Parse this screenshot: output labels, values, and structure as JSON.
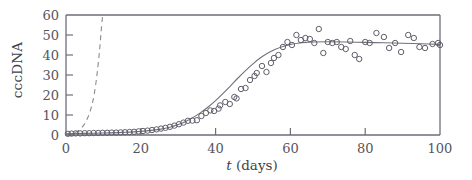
{
  "chart_data": {
    "type": "scatter",
    "title": "",
    "xlabel": "t (days)",
    "xlabel_italic_part": "t",
    "xlabel_rest": " (days)",
    "ylabel": "cccDNA",
    "xlim": [
      0,
      100
    ],
    "ylim": [
      0,
      60
    ],
    "xticks": [
      0,
      20,
      40,
      60,
      80,
      100
    ],
    "xtick_labels": [
      "0",
      "20",
      "40",
      "60",
      "80",
      "100"
    ],
    "yticks": [
      0,
      10,
      20,
      30,
      40,
      50,
      60
    ],
    "ytick_labels": [
      "0",
      "10",
      "20",
      "30",
      "40",
      "50",
      "60"
    ],
    "grid": false,
    "legend": "none",
    "series": [
      {
        "name": "cccDNA measurements",
        "marker": "open-circle",
        "color": "#5f5f6b",
        "points": [
          [
            0.5,
            0.6
          ],
          [
            1.5,
            0.7
          ],
          [
            2.6,
            0.8
          ],
          [
            3.8,
            0.8
          ],
          [
            5.0,
            0.9
          ],
          [
            6.2,
            0.9
          ],
          [
            7.4,
            1.0
          ],
          [
            8.6,
            1.0
          ],
          [
            9.8,
            1.1
          ],
          [
            11.0,
            1.1
          ],
          [
            12.2,
            1.2
          ],
          [
            13.4,
            1.2
          ],
          [
            14.6,
            1.3
          ],
          [
            15.8,
            1.4
          ],
          [
            17.0,
            1.5
          ],
          [
            18.2,
            1.6
          ],
          [
            19.4,
            1.8
          ],
          [
            20.6,
            2.0
          ],
          [
            21.8,
            2.2
          ],
          [
            23.0,
            2.5
          ],
          [
            24.2,
            2.8
          ],
          [
            25.4,
            3.2
          ],
          [
            26.6,
            3.6
          ],
          [
            27.8,
            4.1
          ],
          [
            29.0,
            4.7
          ],
          [
            30.2,
            5.4
          ],
          [
            31.4,
            6.2
          ],
          [
            32.6,
            7.1
          ],
          [
            33.8,
            7.2
          ],
          [
            35.0,
            7.4
          ],
          [
            36.2,
            9.5
          ],
          [
            37.4,
            11.0
          ],
          [
            38.6,
            12.3
          ],
          [
            39.6,
            12.0
          ],
          [
            40.8,
            13.2
          ],
          [
            41.2,
            14.8
          ],
          [
            42.6,
            16.5
          ],
          [
            43.8,
            15.5
          ],
          [
            45.0,
            19.0
          ],
          [
            45.6,
            18.3
          ],
          [
            46.8,
            23.0
          ],
          [
            48.0,
            23.5
          ],
          [
            49.2,
            27.5
          ],
          [
            50.4,
            29.5
          ],
          [
            51.0,
            31.0
          ],
          [
            52.4,
            34.5
          ],
          [
            53.6,
            31.5
          ],
          [
            54.8,
            36.0
          ],
          [
            55.6,
            38.5
          ],
          [
            56.8,
            40.0
          ],
          [
            58.0,
            44.0
          ],
          [
            59.2,
            46.5
          ],
          [
            60.4,
            45.0
          ],
          [
            61.6,
            50.0
          ],
          [
            62.8,
            47.5
          ],
          [
            64.0,
            48.5
          ],
          [
            65.2,
            48.0
          ],
          [
            66.4,
            46.0
          ],
          [
            67.6,
            53.0
          ],
          [
            68.8,
            41.0
          ],
          [
            70.0,
            46.5
          ],
          [
            71.2,
            46.0
          ],
          [
            72.4,
            46.5
          ],
          [
            73.6,
            44.0
          ],
          [
            74.8,
            43.0
          ],
          [
            76.0,
            47.0
          ],
          [
            77.2,
            40.0
          ],
          [
            78.4,
            38.0
          ],
          [
            80.0,
            46.5
          ],
          [
            81.2,
            46.0
          ],
          [
            83.0,
            51.0
          ],
          [
            85.0,
            49.0
          ],
          [
            86.4,
            43.5
          ],
          [
            88.0,
            46.0
          ],
          [
            89.6,
            41.5
          ],
          [
            91.5,
            50.0
          ],
          [
            93.0,
            48.5
          ],
          [
            94.5,
            44.0
          ],
          [
            96.0,
            43.5
          ],
          [
            98.0,
            45.5
          ],
          [
            99.5,
            46.0
          ],
          [
            100.0,
            45.0
          ]
        ]
      }
    ],
    "curves": [
      {
        "name": "sigmoid-fit",
        "style": "solid",
        "color": "#70707c",
        "description": "Fitted logistic growth curve: slow rise to day 30, steep rise day 35-60, plateau near 46",
        "points": [
          [
            0,
            0.6
          ],
          [
            5,
            0.8
          ],
          [
            10,
            1.0
          ],
          [
            15,
            1.3
          ],
          [
            20,
            1.8
          ],
          [
            25,
            2.8
          ],
          [
            28,
            4.0
          ],
          [
            30,
            5.2
          ],
          [
            32,
            6.8
          ],
          [
            34,
            8.8
          ],
          [
            36,
            11.2
          ],
          [
            38,
            14.0
          ],
          [
            40,
            17.2
          ],
          [
            42,
            20.8
          ],
          [
            44,
            24.6
          ],
          [
            46,
            28.5
          ],
          [
            48,
            32.2
          ],
          [
            50,
            35.6
          ],
          [
            52,
            38.6
          ],
          [
            54,
            41.0
          ],
          [
            56,
            42.9
          ],
          [
            58,
            44.3
          ],
          [
            60,
            45.3
          ],
          [
            62,
            45.9
          ],
          [
            64,
            46.3
          ],
          [
            66,
            46.5
          ],
          [
            70,
            46.6
          ],
          [
            75,
            46.5
          ],
          [
            80,
            46.3
          ],
          [
            85,
            46.1
          ],
          [
            90,
            45.9
          ],
          [
            95,
            45.6
          ],
          [
            100,
            45.3
          ]
        ]
      },
      {
        "name": "dashed-exponential",
        "style": "dashed",
        "color": "#8a8a94",
        "description": "Dashed exponential curve rising steeply from origin, exceeding axis top near day 9",
        "points": [
          [
            0.0,
            0.4
          ],
          [
            1.0,
            0.6
          ],
          [
            2.0,
            1.0
          ],
          [
            3.0,
            1.8
          ],
          [
            4.0,
            3.2
          ],
          [
            5.0,
            5.6
          ],
          [
            5.8,
            8.6
          ],
          [
            6.4,
            11.5
          ],
          [
            7.0,
            15.5
          ],
          [
            7.5,
            20.0
          ],
          [
            8.0,
            26.0
          ],
          [
            8.4,
            32.0
          ],
          [
            8.8,
            39.0
          ],
          [
            9.1,
            45.0
          ],
          [
            9.4,
            52.0
          ],
          [
            9.7,
            58.0
          ],
          [
            9.9,
            60.0
          ]
        ]
      }
    ]
  }
}
